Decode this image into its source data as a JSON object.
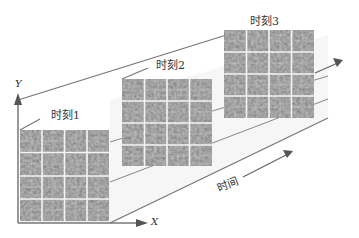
{
  "diagram": {
    "title": "",
    "axes": {
      "y_label": "Y",
      "x_label": "X",
      "time_label": "时间"
    },
    "frames": [
      {
        "label": "时刻1",
        "grid_rows": 4,
        "grid_cols": 4
      },
      {
        "label": "时刻2",
        "grid_rows": 4,
        "grid_cols": 4
      },
      {
        "label": "时刻3",
        "grid_rows": 4,
        "grid_cols": 4
      }
    ],
    "colors": {
      "panel": "#5a5a5a",
      "grid_line": "#f2f2f2",
      "slab_face": "#efefef",
      "edge": "#6a6a6a",
      "text": "#333333"
    }
  }
}
